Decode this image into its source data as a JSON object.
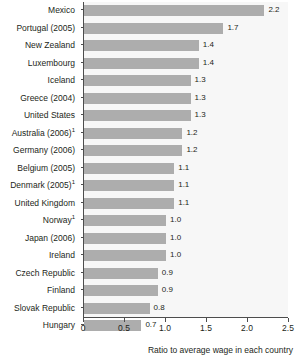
{
  "chart_data": {
    "type": "bar",
    "orientation": "horizontal",
    "title": "",
    "xlabel": "Ratio to average wage in each country",
    "ylabel": "",
    "xlim": [
      0,
      2.5
    ],
    "xticks": [
      0,
      0.5,
      1.0,
      1.5,
      2.0,
      2.5
    ],
    "xtick_labels": [
      "0",
      "0.5",
      "1.0",
      "1.5",
      "2.0",
      "2.5"
    ],
    "grid": false,
    "legend": false,
    "bar_color": "#adadad",
    "plot_background": "#f7f7f7",
    "axis_color": "#4d4d4d",
    "categories": [
      "Mexico",
      "Portugal (2005)",
      "New Zealand",
      "Luxembourg",
      "Iceland",
      "Greece (2004)",
      "United States",
      "Australia (2006)",
      "Germany (2006)",
      "Belgium (2005)",
      "Denmark (2005)",
      "United Kingdom",
      "Norway",
      "Japan (2006)",
      "Ireland",
      "Czech Republic",
      "Finland",
      "Slovak Republic",
      "Hungary"
    ],
    "category_footnotes": [
      "",
      "",
      "",
      "",
      "",
      "",
      "",
      "1",
      "",
      "",
      "1",
      "",
      "1",
      "",
      "",
      "",
      "",
      "",
      ""
    ],
    "values": [
      2.2,
      1.7,
      1.4,
      1.4,
      1.3,
      1.3,
      1.3,
      1.2,
      1.2,
      1.1,
      1.1,
      1.1,
      1.0,
      1.0,
      1.0,
      0.9,
      0.9,
      0.8,
      0.7
    ],
    "value_labels": [
      "2.2",
      "1.7",
      "1.4",
      "1.4",
      "1.3",
      "1.3",
      "1.3",
      "1.2",
      "1.2",
      "1.1",
      "1.1",
      "1.1",
      "1.0",
      "1.0",
      "1.0",
      "0.9",
      "0.9",
      "0.8",
      "0.7"
    ]
  }
}
